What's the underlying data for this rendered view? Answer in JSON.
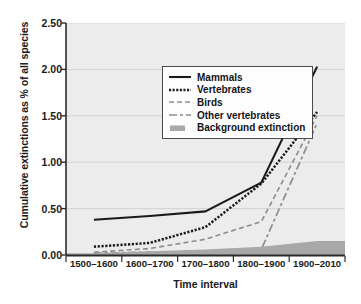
{
  "chart_data": {
    "type": "line",
    "title": "",
    "xlabel": "Time interval",
    "ylabel": "Cumulative extinctions as % of all species",
    "categories": [
      "1500–1600",
      "1600–1700",
      "1700–1800",
      "1800–1900",
      "1900–2010"
    ],
    "yticks": [
      0.0,
      0.5,
      1.0,
      1.5,
      2.0,
      2.5
    ],
    "ytick_labels": [
      "0.00",
      "0.50",
      "1.00",
      "1.50",
      "2.00",
      "2.50"
    ],
    "ylim": [
      0.0,
      2.5
    ],
    "grid": true,
    "legend_position": "upper left",
    "series": [
      {
        "name": "Mammals",
        "style": "solid",
        "color": "#1a1a1a",
        "values": [
          0.38,
          0.42,
          0.47,
          0.78,
          2.03
        ]
      },
      {
        "name": "Vertebrates",
        "style": "dotted",
        "color": "#1a1a1a",
        "values": [
          0.09,
          0.13,
          0.3,
          0.77,
          1.54
        ]
      },
      {
        "name": "Birds",
        "style": "dashed",
        "color": "#8c8c8c",
        "values": [
          0.03,
          0.07,
          0.17,
          0.36,
          1.5
        ]
      },
      {
        "name": "Other vertebrates",
        "style": "dash-dot",
        "color": "#8c8c8c",
        "values": [
          0.02,
          0.03,
          0.04,
          0.06,
          1.42
        ]
      },
      {
        "name": "Background extinction",
        "style": "filled-area",
        "color": "#a8a8a8",
        "values": [
          0.02,
          0.04,
          0.06,
          0.09,
          0.15
        ]
      }
    ],
    "annotations": []
  },
  "legend": {
    "items": [
      {
        "label": "Mammals",
        "swatch": "solid-line-swatch"
      },
      {
        "label": "Vertebrates",
        "swatch": "dotted-line-swatch"
      },
      {
        "label": "Birds",
        "swatch": "dashed-line-swatch"
      },
      {
        "label": "Other vertebrates",
        "swatch": "dash-dot-line-swatch"
      },
      {
        "label": "Background extinction",
        "swatch": "filled-area-swatch"
      }
    ]
  },
  "colors": {
    "plot_background": "#ececed",
    "grid": "#d2d2d4",
    "axis": "#2b2b2b",
    "dark_series": "#1a1a1a",
    "gray_series": "#8c8c8c",
    "background_band": "#a8a8a8"
  }
}
